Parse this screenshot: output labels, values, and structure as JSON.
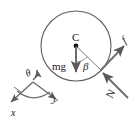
{
  "figure": {
    "type": "free-body-diagram",
    "background_color": "#ffffff",
    "stroke_color": "#555555",
    "label_color": "#1a1a1a"
  },
  "disk": {
    "center_label": "C",
    "center_x": 76,
    "center_y": 46,
    "radius": 35
  },
  "forces": [
    {
      "name": "weight",
      "label": "mg",
      "from": [
        76,
        46
      ],
      "to": [
        76,
        74
      ],
      "label_x": 55,
      "label_y": 67
    },
    {
      "name": "friction",
      "label": "f",
      "from": [
        101,
        70
      ],
      "to": [
        126,
        45
      ],
      "label_x": 127,
      "label_y": 42
    },
    {
      "name": "normal",
      "label": "N",
      "from": [
        128,
        97
      ],
      "to": [
        101,
        72
      ],
      "label_x": 117,
      "label_y": 95
    }
  ],
  "angles": [
    {
      "name": "beta",
      "label": "β",
      "label_x": 84,
      "label_y": 66,
      "between": [
        "weight",
        "contact-radius"
      ]
    },
    {
      "name": "theta",
      "label": "θ",
      "label_x": 29,
      "label_y": 74,
      "between": [
        "x-axis",
        "y-axis"
      ]
    }
  ],
  "axes": {
    "origin": [
      33,
      82
    ],
    "items": [
      {
        "name": "x-axis",
        "label": "x",
        "tip": [
          9,
          103
        ],
        "label_x": 13,
        "label_y": 114
      },
      {
        "name": "y-axis",
        "label": "y",
        "tip": [
          58,
          100
        ],
        "label_x": 55,
        "label_y": 102
      }
    ]
  }
}
